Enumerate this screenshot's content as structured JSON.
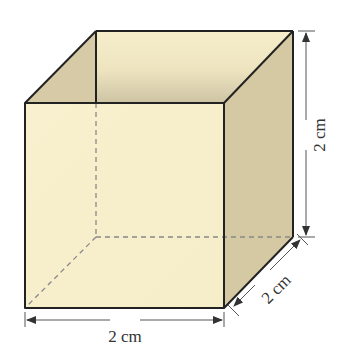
{
  "figure": {
    "type": "cube",
    "labels": {
      "width": "2 cm",
      "height": "2 cm",
      "depth": "2 cm"
    },
    "colors": {
      "front_face": "#f7efcc",
      "right_face": "#d5c9a3",
      "left_inner_face": "#d6cba6",
      "back_face_top": "#f5edca",
      "back_face_bottom": "#cfc6a6",
      "edge": "#222222",
      "hidden_edge": "#888888",
      "dimension_line": "#555555"
    }
  }
}
